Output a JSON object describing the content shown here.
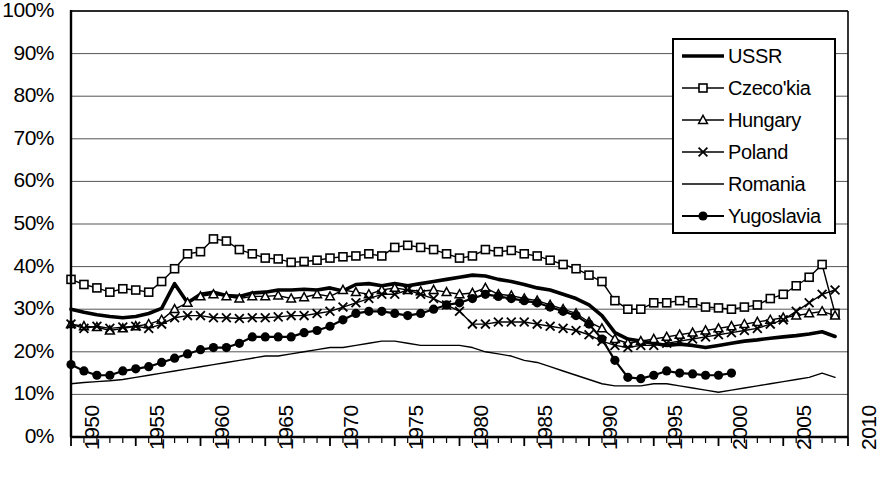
{
  "chart_data": {
    "type": "line",
    "title": "",
    "xlabel": "",
    "ylabel": "",
    "xlim": [
      1950,
      2010
    ],
    "ylim": [
      0,
      100
    ],
    "ytick_labels": [
      "100%",
      "90%",
      "80%",
      "70%",
      "60%",
      "50%",
      "40%",
      "30%",
      "20%",
      "10%",
      "0%"
    ],
    "ytick_values": [
      100,
      90,
      80,
      70,
      60,
      50,
      40,
      30,
      20,
      10,
      0
    ],
    "xtick_labels": [
      "1950",
      "1955",
      "1960",
      "1965",
      "1970",
      "1975",
      "1980",
      "1985",
      "1990",
      "1995",
      "2000",
      "2005",
      "2010"
    ],
    "xtick_values": [
      1950,
      1955,
      1960,
      1965,
      1970,
      1975,
      1980,
      1985,
      1990,
      1995,
      2000,
      2005,
      2010
    ],
    "minor_xticks_every": 1,
    "grid": "horizontal",
    "legend_position": "top-right",
    "series": [
      {
        "name": "USSR",
        "marker": "none",
        "line_width": "thick",
        "color": "#000000",
        "x": [
          1950,
          1951,
          1952,
          1953,
          1954,
          1955,
          1956,
          1957,
          1958,
          1959,
          1960,
          1961,
          1962,
          1963,
          1964,
          1965,
          1966,
          1967,
          1968,
          1969,
          1970,
          1971,
          1972,
          1973,
          1974,
          1975,
          1976,
          1977,
          1978,
          1979,
          1980,
          1981,
          1982,
          1983,
          1984,
          1985,
          1986,
          1987,
          1988,
          1989,
          1990,
          1991,
          1992,
          1993,
          1994,
          1995,
          1996,
          1997,
          1998,
          1999,
          2000,
          2001,
          2002,
          2003,
          2004,
          2005,
          2006,
          2007,
          2008,
          2009
        ],
        "values": [
          30.0,
          29.3,
          28.7,
          28.3,
          28.0,
          28.3,
          29.0,
          30.2,
          36.0,
          31.5,
          33.5,
          34.0,
          33.2,
          33.0,
          33.8,
          34.0,
          34.5,
          34.5,
          34.7,
          34.5,
          35.0,
          34.3,
          35.8,
          36.0,
          35.5,
          36.0,
          35.5,
          36.0,
          36.5,
          37.0,
          37.5,
          38.0,
          37.8,
          37.0,
          36.5,
          35.8,
          35.0,
          34.5,
          33.5,
          32.5,
          31.0,
          28.5,
          24.5,
          23.0,
          22.5,
          22.0,
          21.5,
          21.8,
          21.5,
          21.0,
          21.5,
          22.0,
          22.5,
          22.8,
          23.2,
          23.5,
          23.8,
          24.2,
          24.7,
          23.6
        ]
      },
      {
        "name": "Czeco'kia",
        "marker": "square-open",
        "line_width": "thin",
        "color": "#000000",
        "x": [
          1950,
          1951,
          1952,
          1953,
          1954,
          1955,
          1956,
          1957,
          1958,
          1959,
          1960,
          1961,
          1962,
          1963,
          1964,
          1965,
          1966,
          1967,
          1968,
          1969,
          1970,
          1971,
          1972,
          1973,
          1974,
          1975,
          1976,
          1977,
          1978,
          1979,
          1980,
          1981,
          1982,
          1983,
          1984,
          1985,
          1986,
          1987,
          1988,
          1989,
          1990,
          1991,
          1992,
          1993,
          1994,
          1995,
          1996,
          1997,
          1998,
          1999,
          2000,
          2001,
          2002,
          2003,
          2004,
          2005,
          2006,
          2007,
          2008,
          2009
        ],
        "values": [
          37.0,
          35.8,
          35.0,
          34.0,
          34.8,
          34.5,
          34.0,
          36.5,
          39.5,
          43.0,
          43.5,
          46.5,
          46.0,
          44.0,
          43.0,
          42.0,
          41.8,
          41.0,
          41.2,
          41.5,
          42.0,
          42.3,
          42.5,
          43.0,
          42.5,
          44.5,
          45.0,
          44.5,
          44.0,
          43.0,
          42.0,
          42.5,
          44.0,
          43.5,
          43.8,
          43.0,
          42.5,
          41.5,
          40.5,
          39.5,
          38.0,
          36.5,
          32.0,
          30.0,
          30.0,
          31.5,
          31.5,
          32.0,
          31.5,
          30.5,
          30.3,
          30.0,
          30.5,
          31.0,
          32.5,
          33.5,
          35.5,
          37.5,
          40.5,
          29.0
        ]
      },
      {
        "name": "Hungary",
        "marker": "triangle-open",
        "line_width": "thin",
        "color": "#000000",
        "x": [
          1950,
          1951,
          1952,
          1953,
          1954,
          1955,
          1956,
          1957,
          1958,
          1959,
          1960,
          1961,
          1962,
          1963,
          1964,
          1965,
          1966,
          1967,
          1968,
          1969,
          1970,
          1971,
          1972,
          1973,
          1974,
          1975,
          1976,
          1977,
          1978,
          1979,
          1980,
          1981,
          1982,
          1983,
          1984,
          1985,
          1986,
          1987,
          1988,
          1989,
          1990,
          1991,
          1992,
          1993,
          1994,
          1995,
          1996,
          1997,
          1998,
          1999,
          2000,
          2001,
          2002,
          2003,
          2004,
          2005,
          2006,
          2007,
          2008,
          2009
        ],
        "values": [
          26.5,
          26.0,
          25.8,
          25.0,
          25.5,
          26.0,
          26.5,
          27.5,
          30.0,
          31.5,
          33.0,
          33.5,
          33.0,
          32.5,
          33.0,
          33.0,
          33.2,
          32.5,
          32.8,
          33.5,
          33.0,
          34.5,
          34.0,
          33.5,
          34.5,
          35.0,
          34.5,
          34.2,
          34.5,
          34.0,
          33.5,
          33.8,
          35.0,
          33.5,
          33.2,
          32.5,
          32.0,
          31.0,
          30.0,
          29.0,
          27.0,
          25.5,
          23.0,
          22.0,
          22.5,
          23.0,
          23.5,
          24.0,
          24.5,
          25.0,
          25.5,
          26.0,
          26.5,
          27.0,
          27.5,
          28.0,
          28.5,
          29.0,
          29.5,
          28.5
        ]
      },
      {
        "name": "Poland",
        "marker": "x",
        "line_width": "thin",
        "color": "#000000",
        "x": [
          1950,
          1951,
          1952,
          1953,
          1954,
          1955,
          1956,
          1957,
          1958,
          1959,
          1960,
          1961,
          1962,
          1963,
          1964,
          1965,
          1966,
          1967,
          1968,
          1969,
          1970,
          1971,
          1972,
          1973,
          1974,
          1975,
          1976,
          1977,
          1978,
          1979,
          1980,
          1981,
          1982,
          1983,
          1984,
          1985,
          1986,
          1987,
          1988,
          1989,
          1990,
          1991,
          1992,
          1993,
          1994,
          1995,
          1996,
          1997,
          1998,
          1999,
          2000,
          2001,
          2002,
          2003,
          2004,
          2005,
          2006,
          2007,
          2008,
          2009
        ],
        "values": [
          26.5,
          25.5,
          26.0,
          25.5,
          25.8,
          26.0,
          25.5,
          26.5,
          28.0,
          28.5,
          28.5,
          28.0,
          28.0,
          27.8,
          28.0,
          28.0,
          28.2,
          28.5,
          28.5,
          29.0,
          29.5,
          30.5,
          31.5,
          32.5,
          33.5,
          33.5,
          34.5,
          33.5,
          32.5,
          31.0,
          29.5,
          26.5,
          26.5,
          27.0,
          27.0,
          27.0,
          26.5,
          26.0,
          25.5,
          25.0,
          24.0,
          22.5,
          21.5,
          21.0,
          21.5,
          21.5,
          22.0,
          22.5,
          23.0,
          23.5,
          24.0,
          24.5,
          25.0,
          25.5,
          26.5,
          27.5,
          29.5,
          31.5,
          33.5,
          34.5
        ]
      },
      {
        "name": "Romania",
        "marker": "none",
        "line_width": "thin",
        "color": "#000000",
        "x": [
          1950,
          1951,
          1952,
          1953,
          1954,
          1955,
          1956,
          1957,
          1958,
          1959,
          1960,
          1961,
          1962,
          1963,
          1964,
          1965,
          1966,
          1967,
          1968,
          1969,
          1970,
          1971,
          1972,
          1973,
          1974,
          1975,
          1976,
          1977,
          1978,
          1979,
          1980,
          1981,
          1982,
          1983,
          1984,
          1985,
          1986,
          1987,
          1988,
          1989,
          1990,
          1991,
          1992,
          1993,
          1994,
          1995,
          1996,
          1997,
          1998,
          1999,
          2000,
          2001,
          2002,
          2003,
          2004,
          2005,
          2006,
          2007,
          2008,
          2009
        ],
        "values": [
          12.5,
          12.8,
          13.0,
          13.2,
          13.5,
          14.0,
          14.5,
          15.0,
          15.5,
          16.0,
          16.5,
          17.0,
          17.5,
          18.0,
          18.5,
          19.0,
          19.0,
          19.5,
          20.0,
          20.5,
          21.0,
          21.0,
          21.5,
          22.0,
          22.5,
          22.5,
          22.0,
          21.5,
          21.5,
          21.5,
          21.5,
          21.0,
          20.0,
          19.5,
          19.0,
          18.0,
          17.5,
          16.5,
          15.5,
          14.5,
          13.5,
          12.5,
          12.0,
          12.0,
          12.0,
          12.5,
          12.5,
          12.0,
          11.5,
          11.0,
          10.5,
          11.0,
          11.5,
          12.0,
          12.5,
          13.0,
          13.5,
          14.0,
          15.0,
          14.0
        ]
      },
      {
        "name": "Yugoslavia",
        "marker": "circle-filled",
        "line_width": "medium",
        "color": "#000000",
        "x": [
          1950,
          1951,
          1952,
          1953,
          1954,
          1955,
          1956,
          1957,
          1958,
          1959,
          1960,
          1961,
          1962,
          1963,
          1964,
          1965,
          1966,
          1967,
          1968,
          1969,
          1970,
          1971,
          1972,
          1973,
          1974,
          1975,
          1976,
          1977,
          1978,
          1979,
          1980,
          1981,
          1982,
          1983,
          1984,
          1985,
          1986,
          1987,
          1988,
          1989,
          1990,
          1991,
          1992,
          1993,
          1994,
          1995,
          1996,
          1997,
          1998,
          1999,
          2000,
          2001
        ],
        "values": [
          17.0,
          15.5,
          14.5,
          14.5,
          15.5,
          16.0,
          16.5,
          17.5,
          18.5,
          19.5,
          20.5,
          21.0,
          21.0,
          22.0,
          23.5,
          23.5,
          23.5,
          23.5,
          24.5,
          25.0,
          26.0,
          27.5,
          29.0,
          29.5,
          29.5,
          29.0,
          28.5,
          29.0,
          30.0,
          31.0,
          31.5,
          32.5,
          33.5,
          33.0,
          32.5,
          32.0,
          31.5,
          30.5,
          29.5,
          28.5,
          26.5,
          23.0,
          18.0,
          14.0,
          13.7,
          14.5,
          15.5,
          15.0,
          14.8,
          14.5,
          14.5,
          15.0
        ]
      }
    ]
  },
  "legend": {
    "items": [
      {
        "label": "USSR",
        "marker": "none",
        "weight": "thick"
      },
      {
        "label": "Czeco'kia",
        "marker": "square-open",
        "weight": "thin"
      },
      {
        "label": "Hungary",
        "marker": "triangle-open",
        "weight": "thin"
      },
      {
        "label": "Poland",
        "marker": "x",
        "weight": "thin"
      },
      {
        "label": "Romania",
        "marker": "none",
        "weight": "thin"
      },
      {
        "label": "Yugoslavia",
        "marker": "circle-filled",
        "weight": "medium"
      }
    ]
  },
  "axes": {
    "y_labels": [
      "100%",
      "90%",
      "80%",
      "70%",
      "60%",
      "50%",
      "40%",
      "30%",
      "20%",
      "10%",
      "0%"
    ],
    "x_labels": [
      "1950",
      "1955",
      "1960",
      "1965",
      "1970",
      "1975",
      "1980",
      "1985",
      "1990",
      "1995",
      "2000",
      "2005",
      "2010"
    ]
  }
}
